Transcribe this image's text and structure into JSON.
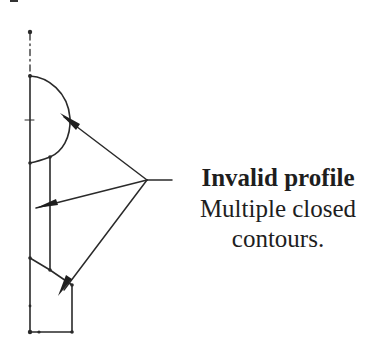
{
  "callout": {
    "title": "Invalid profile",
    "description_line1": "Multiple closed",
    "description_line2": "contours."
  },
  "colors": {
    "stroke": "#2a2a2a",
    "text": "#1e1e1e",
    "background": "#ffffff"
  },
  "diagram": {
    "centerline": {
      "x": 30,
      "y_top": 32,
      "y_bottom": 75,
      "style": "dash-dot"
    },
    "arrow_origin": {
      "x": 147,
      "y": 180
    },
    "arrow_targets": [
      {
        "x": 62,
        "y": 116
      },
      {
        "x": 34,
        "y": 208
      },
      {
        "x": 62,
        "y": 292
      }
    ],
    "leader_end": {
      "x": 172,
      "y": 180
    }
  }
}
